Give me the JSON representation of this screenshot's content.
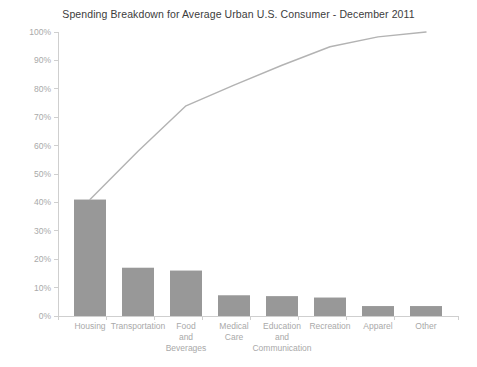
{
  "chart_data": {
    "type": "bar",
    "title": "Spending Breakdown for Average Urban U.S. Consumer - December 2011",
    "xlabel": "",
    "ylabel": "",
    "ylim": [
      0,
      100
    ],
    "grid": false,
    "legend": "none",
    "categories": [
      "Housing",
      "Transportation",
      "Food and Beverages",
      "Medical Care",
      "Education and Communication",
      "Recreation",
      "Apparel",
      "Other"
    ],
    "category_lines": [
      [
        "Housing"
      ],
      [
        "Transportation"
      ],
      [
        "Food",
        "and",
        "Beverages"
      ],
      [
        "Medical",
        "Care"
      ],
      [
        "Education",
        "and",
        "Communication"
      ],
      [
        "Recreation"
      ],
      [
        "Apparel"
      ],
      [
        "Other"
      ]
    ],
    "values": [
      41,
      17,
      16,
      7.3,
      7,
      6.5,
      3.5,
      3.5
    ],
    "series": [
      {
        "name": "Share of spending",
        "type": "bar",
        "values": [
          41,
          17,
          16,
          7.3,
          7,
          6.5,
          3.5,
          3.5
        ]
      },
      {
        "name": "Cumulative",
        "type": "line",
        "values": [
          41,
          58,
          74,
          81.3,
          88.3,
          94.8,
          98.3,
          100
        ]
      }
    ],
    "y_ticks": [
      "0%",
      "10%",
      "20%",
      "30%",
      "40%",
      "50%",
      "60%",
      "70%",
      "80%",
      "90%",
      "100%"
    ],
    "y_tick_values": [
      0,
      10,
      20,
      30,
      40,
      50,
      60,
      70,
      80,
      90,
      100
    ],
    "colors": {
      "bar": "#989898",
      "line": "#b3b3b3",
      "axis": "#cfcfcf",
      "tick_text": "#a9a9a9",
      "title_text": "#3c3c3c",
      "background": "#ffffff"
    }
  }
}
